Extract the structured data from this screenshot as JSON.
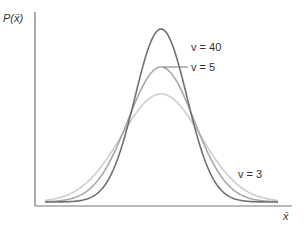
{
  "chart_data": {
    "type": "line",
    "title": "",
    "xlabel": "x̄",
    "ylabel": "P(x̄)",
    "grid": false,
    "legend": "inline labels",
    "series": [
      {
        "name": "ν = 40",
        "label": "v = 40",
        "color": "#707070",
        "peak_px": 29,
        "sigma_px": 26
      },
      {
        "name": "ν = 5",
        "label": "v = 5",
        "color": "#a8a8a8",
        "peak_px": 67,
        "sigma_px": 33
      },
      {
        "name": "ν = 3",
        "label": "v = 3",
        "color": "#cdcdcd",
        "peak_px": 94,
        "sigma_px": 40
      }
    ],
    "annotations": [
      "v = 40",
      "v = 5",
      "v = 3"
    ]
  },
  "labels": {
    "y_axis": "P(x̄)",
    "x_axis": "x̄",
    "nu40": "v = 40",
    "nu5": "v = 5",
    "nu3": "v = 3"
  }
}
